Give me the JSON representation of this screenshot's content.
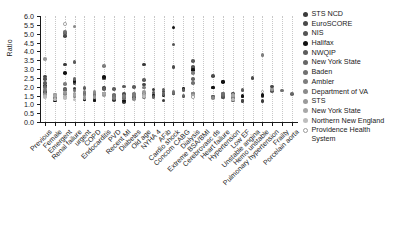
{
  "chart_data": {
    "type": "scatter",
    "title": "",
    "xlabel": "",
    "ylabel": "Ratio",
    "ylim": [
      0.0,
      6.0
    ],
    "yticks": [
      "0.0",
      "0.5",
      "1.0",
      "1.5",
      "2.0",
      "2.5",
      "3.0",
      "3.5",
      "4.0",
      "4.5",
      "5.0",
      "5.5",
      "6.0"
    ],
    "grid": "vertical-dotted",
    "legend_position": "right",
    "categories": [
      "Previous",
      "Female",
      "Emergent",
      "Renal failure",
      "urgent",
      "COPD",
      "Endocarditis",
      "PVD",
      "Recent MI",
      "Diabetes",
      "Old age",
      "NYHA 4",
      "AFib",
      "Cardio shock",
      "Concom CABG",
      "Dialysis",
      "Extreme BSA/BMI",
      "Cerebrovasc ds",
      "Heart failure",
      "Hypertension",
      "Low EF",
      "Unstable angina",
      "Hemo unstable",
      "Pulmonary hypertension",
      "Frailty",
      "Porcelain aorta"
    ],
    "series": [
      {
        "name": "STS NCD",
        "color": "#3b3b3b",
        "points": [
          [
            "Previous",
            1.7
          ],
          [
            "Female",
            1.3
          ],
          [
            "Emergent",
            3.25
          ],
          [
            "Renal failure",
            1.9
          ],
          [
            "urgent",
            1.28
          ],
          [
            "COPD",
            1.25
          ],
          [
            "Endocarditis",
            1.93
          ],
          [
            "PVD",
            1.25
          ],
          [
            "Recent MI",
            1.12
          ],
          [
            "Diabetes",
            1.42
          ],
          [
            "Old age",
            3.25
          ],
          [
            "NYHA 4",
            1.85
          ],
          [
            "AFib",
            1.22
          ],
          [
            "Cardio shock",
            1.62
          ],
          [
            "Dialysis",
            1.62
          ],
          [
            "Cerebrovasc ds",
            1.45
          ],
          [
            "Heart failure",
            2.3
          ],
          [
            "Hypertension",
            1.35
          ],
          [
            "Low EF",
            1.18
          ],
          [
            "Hemo unstable",
            1.2
          ]
        ]
      },
      {
        "name": "EuroSCORE",
        "color": "#4a4a4a",
        "points": [
          [
            "Previous",
            2.58
          ],
          [
            "Female",
            1.38
          ],
          [
            "Emergent",
            4.88
          ],
          [
            "Renal failure",
            2.2
          ],
          [
            "urgent",
            1.6
          ],
          [
            "COPD",
            1.3
          ],
          [
            "Endocarditis",
            2.5
          ],
          [
            "PVD",
            1.48
          ],
          [
            "Recent MI",
            1.58
          ],
          [
            "Diabetes",
            1.38
          ],
          [
            "Old age",
            2.12
          ],
          [
            "NYHA 4",
            1.5
          ],
          [
            "AFib",
            1.72
          ],
          [
            "Cardio shock",
            3.1
          ],
          [
            "Concom CABG",
            1.45
          ],
          [
            "Dialysis",
            3.05
          ],
          [
            "Cerebrovasc ds",
            2.62
          ],
          [
            "Heart failure",
            1.42
          ],
          [
            "Hypertension",
            1.62
          ],
          [
            "Low EF",
            1.22
          ],
          [
            "Unstable angina",
            2.5
          ],
          [
            "Hemo unstable",
            1.48
          ],
          [
            "Pulmonary hypertension",
            2.02
          ]
        ]
      },
      {
        "name": "NIS",
        "color": "#555555",
        "points": [
          [
            "Previous",
            2.42
          ],
          [
            "Female",
            1.25
          ],
          [
            "Emergent",
            5.02
          ],
          [
            "Renal failure",
            2.28
          ],
          [
            "urgent",
            1.62
          ],
          [
            "COPD",
            1.35
          ],
          [
            "Endocarditis",
            2.46
          ],
          [
            "PVD",
            1.42
          ],
          [
            "Recent MI",
            1.45
          ],
          [
            "Diabetes",
            1.4
          ],
          [
            "Old age",
            1.6
          ],
          [
            "NYHA 4",
            1.52
          ],
          [
            "AFib",
            1.55
          ],
          [
            "Cardio shock",
            4.38
          ],
          [
            "Concom CABG",
            1.9
          ],
          [
            "Dialysis",
            3.12
          ],
          [
            "Cerebrovasc ds",
            1.95
          ],
          [
            "Heart failure",
            1.4
          ],
          [
            "Hypertension",
            1.55
          ],
          [
            "Low EF",
            1.45
          ],
          [
            "Pulmonary hypertension",
            1.75
          ]
        ]
      },
      {
        "name": "Halifax",
        "color": "#111111",
        "points": [
          [
            "Previous",
            2.05
          ],
          [
            "Female",
            1.22
          ],
          [
            "Emergent",
            2.78
          ],
          [
            "Renal failure",
            2.32
          ],
          [
            "urgent",
            1.3
          ],
          [
            "COPD",
            1.22
          ],
          [
            "Endocarditis",
            2.55
          ],
          [
            "PVD",
            1.48
          ],
          [
            "Recent MI",
            1.22
          ],
          [
            "Diabetes",
            1.45
          ],
          [
            "Old age",
            1.52
          ],
          [
            "NYHA 4",
            1.48
          ],
          [
            "AFib",
            1.5
          ],
          [
            "Cardio shock",
            5.35
          ],
          [
            "Concom CABG",
            1.88
          ],
          [
            "Dialysis",
            2.95
          ],
          [
            "Cerebrovasc ds",
            1.95
          ],
          [
            "Heart failure",
            2.28
          ],
          [
            "Hypertension",
            1.52
          ],
          [
            "Low EF",
            1.48
          ],
          [
            "Hemo unstable",
            1.52
          ]
        ]
      },
      {
        "name": "NWQIP",
        "color": "#5c5c5c",
        "points": [
          [
            "Previous",
            2.2
          ],
          [
            "Female",
            1.42
          ],
          [
            "Emergent",
            1.88
          ],
          [
            "Renal failure",
            3.38
          ],
          [
            "urgent",
            1.92
          ],
          [
            "COPD",
            1.6
          ],
          [
            "Endocarditis",
            1.88
          ],
          [
            "PVD",
            1.88
          ],
          [
            "Recent MI",
            2.02
          ],
          [
            "Diabetes",
            1.98
          ],
          [
            "Old age",
            2.38
          ],
          [
            "NYHA 4",
            1.68
          ],
          [
            "AFib",
            1.85
          ],
          [
            "Cardio shock",
            1.62
          ],
          [
            "Concom CABG",
            1.82
          ],
          [
            "Dialysis",
            3.45
          ],
          [
            "Cerebrovasc ds",
            1.4
          ],
          [
            "Heart failure",
            1.62
          ],
          [
            "Hypertension",
            1.32
          ],
          [
            "Low EF",
            1.82
          ],
          [
            "Pulmonary hypertension",
            1.82
          ]
        ]
      },
      {
        "name": "New York State",
        "color": "#666666",
        "points": [
          [
            "Previous",
            2.02
          ],
          [
            "Female",
            1.35
          ],
          [
            "Emergent",
            1.8
          ],
          [
            "Renal failure",
            2.42
          ],
          [
            "urgent",
            1.55
          ],
          [
            "COPD",
            1.52
          ],
          [
            "Endocarditis",
            1.6
          ],
          [
            "PVD",
            1.42
          ],
          [
            "Recent MI",
            1.4
          ],
          [
            "Diabetes",
            1.48
          ],
          [
            "Old age",
            1.48
          ],
          [
            "NYHA 4",
            1.42
          ],
          [
            "AFib",
            1.58
          ],
          [
            "Concom CABG",
            1.5
          ],
          [
            "Dialysis",
            2.45
          ],
          [
            "Cerebrovasc ds",
            1.38
          ],
          [
            "Heart failure",
            1.52
          ],
          [
            "Hypertension",
            1.22
          ],
          [
            "Porcelain aorta",
            1.58
          ]
        ]
      },
      {
        "name": "Baden",
        "color": "#707070",
        "points": [
          [
            "Previous",
            1.95
          ],
          [
            "Female",
            1.45
          ],
          [
            "Emergent",
            5.1
          ],
          [
            "Renal failure",
            1.78
          ],
          [
            "urgent",
            1.65
          ],
          [
            "COPD",
            1.48
          ],
          [
            "Endocarditis",
            1.62
          ],
          [
            "PVD",
            1.52
          ],
          [
            "Recent MI",
            1.35
          ],
          [
            "Diabetes",
            1.58
          ],
          [
            "Old age",
            1.42
          ],
          [
            "Cardio shock",
            1.7
          ],
          [
            "Dialysis",
            2.2
          ],
          [
            "Heart failure",
            1.58
          ],
          [
            "Hypertension",
            1.45
          ],
          [
            "Frailty",
            1.78
          ]
        ]
      },
      {
        "name": "Ambler",
        "color": "#7d7d7d",
        "points": [
          [
            "Previous",
            1.82
          ],
          [
            "Female",
            1.5
          ],
          [
            "Emergent",
            2.15
          ],
          [
            "Renal failure",
            1.45
          ],
          [
            "urgent",
            1.72
          ],
          [
            "COPD",
            1.62
          ],
          [
            "Endocarditis",
            3.18
          ],
          [
            "PVD",
            1.35
          ],
          [
            "Recent MI",
            1.48
          ],
          [
            "Diabetes",
            1.52
          ],
          [
            "Old age",
            1.95
          ],
          [
            "Dialysis",
            2.78
          ],
          [
            "Hypertension",
            1.4
          ],
          [
            "Hemo unstable",
            3.78
          ]
        ]
      },
      {
        "name": "Department of VA",
        "color": "#8a8a8a",
        "points": [
          [
            "Previous",
            1.6
          ],
          [
            "Female",
            1.52
          ],
          [
            "Emergent",
            1.58
          ],
          [
            "Renal failure",
            5.4
          ],
          [
            "urgent",
            1.5
          ],
          [
            "COPD",
            1.7
          ],
          [
            "Endocarditis",
            1.55
          ],
          [
            "Diabetes",
            1.3
          ],
          [
            "Old age",
            1.52
          ],
          [
            "Dialysis",
            1.62
          ],
          [
            "Cerebrovasc ds",
            1.35
          ],
          [
            "Hypertension",
            1.48
          ]
        ]
      },
      {
        "name": "STS",
        "color": "#9a9a9a",
        "points": [
          [
            "Previous",
            3.58
          ],
          [
            "Female",
            1.55
          ],
          [
            "Emergent",
            1.68
          ],
          [
            "Renal failure",
            1.62
          ],
          [
            "urgent",
            1.35
          ],
          [
            "COPD",
            1.42
          ],
          [
            "Endocarditis",
            1.52
          ],
          [
            "Old age",
            1.7
          ],
          [
            "Dialysis",
            1.45
          ],
          [
            "Hypertension",
            1.55
          ],
          [
            "Pulmonary hypertension",
            1.85
          ]
        ]
      },
      {
        "name": "New York State",
        "color": "#a8a8a8",
        "points": [
          [
            "Previous",
            1.48
          ],
          [
            "Female",
            1.48
          ],
          [
            "Emergent",
            1.42
          ],
          [
            "Renal failure",
            1.52
          ],
          [
            "Endocarditis",
            1.62
          ],
          [
            "Old age",
            1.55
          ],
          [
            "Dialysis",
            1.5
          ],
          [
            "Hypertension",
            1.5
          ]
        ]
      },
      {
        "name": "Northern New England",
        "color": "#bdbdbd",
        "points": [
          [
            "Previous",
            1.42
          ],
          [
            "Female",
            1.28
          ],
          [
            "Emergent",
            1.35
          ],
          [
            "Renal failure",
            1.28
          ],
          [
            "Old age",
            1.45
          ],
          [
            "Hypertension",
            1.28
          ]
        ]
      },
      {
        "name": "Providence Health\nSystem",
        "color": "#ffffff",
        "points": [
          [
            "Emergent",
            5.55
          ],
          [
            "Dialysis",
            1.42
          ],
          [
            "Hemo unstable",
            1.72
          ]
        ]
      }
    ]
  }
}
